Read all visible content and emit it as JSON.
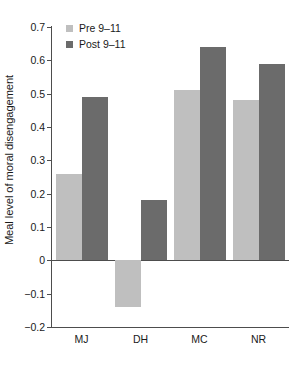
{
  "chart_data": {
    "type": "bar",
    "title": "",
    "subtitle": "",
    "xlabel": "",
    "ylabel": "Meal level of moral disengagement",
    "categories": [
      "MJ",
      "DH",
      "MC",
      "NR"
    ],
    "series": [
      {
        "name": "Pre 9–11",
        "color": "#bfbfbf",
        "values": [
          0.26,
          -0.14,
          0.51,
          0.48
        ]
      },
      {
        "name": "Post 9–11",
        "color": "#6b6b6b",
        "values": [
          0.49,
          0.18,
          0.64,
          0.59
        ]
      }
    ],
    "ylim": [
      -0.2,
      0.7
    ],
    "ytick_step": 0.1,
    "yticks": [
      0.7,
      0.6,
      0.5,
      0.4,
      0.3,
      0.2,
      0.1,
      0,
      -0.1,
      -0.2
    ],
    "ytick_labels": [
      "0.7",
      "0.6",
      "0.5",
      "0.4",
      "0.3",
      "0.2",
      "0.1",
      "0",
      "−0.1",
      "−0.2"
    ],
    "grid": false,
    "legend_position": "top-left",
    "zero_line": true,
    "axis_color": "#4d4d4d",
    "background": "#ffffff"
  },
  "legend": {
    "entries": [
      {
        "label": "Pre 9–11",
        "swatch": "pre-swatch"
      },
      {
        "label": "Post 9–11",
        "swatch": "post-swatch"
      }
    ]
  },
  "axes": {
    "y_title": "Meal level of moral disengagement",
    "y_labels": [
      "0.7",
      "0.6",
      "0.5",
      "0.4",
      "0.3",
      "0.2",
      "0.1",
      "0",
      "−0.1",
      "−0.2"
    ],
    "x_labels": [
      "MJ",
      "DH",
      "MC",
      "NR"
    ]
  }
}
